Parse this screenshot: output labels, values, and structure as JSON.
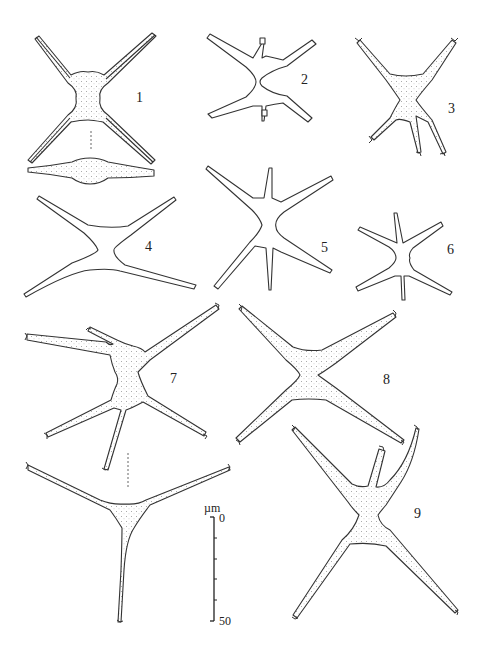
{
  "plate": {
    "figure_labels": [
      "1",
      "2",
      "3",
      "4",
      "5",
      "6",
      "7",
      "8",
      "9"
    ],
    "scale_bar": {
      "unit": "µm",
      "min_label": "0",
      "max_label": "50",
      "ticks": 5
    }
  },
  "figures": [
    {
      "id": "1",
      "description": "four-armed specimen, front view, with side view below",
      "stippled": true
    },
    {
      "id": "2",
      "description": "six-armed specimen, small",
      "stippled": false
    },
    {
      "id": "3",
      "description": "four-armed specimen with forked tips",
      "stippled": true
    },
    {
      "id": "4",
      "description": "four-armed specimen, curved arms",
      "stippled": false
    },
    {
      "id": "5",
      "description": "six-armed specimen",
      "stippled": false
    },
    {
      "id": "6",
      "description": "six-armed specimen, small",
      "stippled": false
    },
    {
      "id": "7",
      "description": "five-armed specimen, front view, with apical view below",
      "stippled": true
    },
    {
      "id": "8",
      "description": "four-armed specimen",
      "stippled": true
    },
    {
      "id": "9",
      "description": "five-armed specimen",
      "stippled": true
    }
  ],
  "colors": {
    "ink": "#333333",
    "background": "#ffffff"
  }
}
